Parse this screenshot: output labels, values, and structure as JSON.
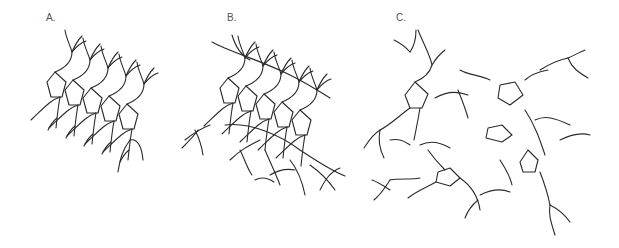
{
  "figure": {
    "panels": [
      {
        "id": "A",
        "label": "A."
      },
      {
        "id": "B",
        "label": "B."
      },
      {
        "id": "C",
        "label": "C."
      }
    ]
  }
}
